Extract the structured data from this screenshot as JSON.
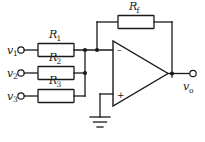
{
  "diagram": {
    "background_color": "#ffffff",
    "line_color": "#1a1a1a"
  },
  "labels": {
    "r1": "R",
    "r1_sub": "1",
    "r2": "R",
    "r2_sub": "2",
    "r3": "R",
    "r3_sub": "3",
    "rf": "R",
    "rf_sub": "f",
    "v1": "v",
    "v1_sub": "1",
    "v2": "v",
    "v2_sub": "2",
    "v3": "v",
    "v3_sub": "3",
    "vo": "v",
    "vo_sub": "o",
    "inverting_sign": "–",
    "noninverting_sign": "+"
  },
  "components": [
    {
      "name": "resistor-r1",
      "label": "R1",
      "type": "resistor"
    },
    {
      "name": "resistor-r2",
      "label": "R2",
      "type": "resistor"
    },
    {
      "name": "resistor-r3",
      "label": "R3",
      "type": "resistor"
    },
    {
      "name": "resistor-rf",
      "label": "Rf",
      "type": "resistor"
    },
    {
      "name": "op-amp",
      "label": "op-amp",
      "type": "amplifier"
    },
    {
      "name": "ground",
      "label": "ground",
      "type": "ground"
    }
  ],
  "terminals": [
    {
      "name": "input-v1",
      "label": "v1"
    },
    {
      "name": "input-v2",
      "label": "v2"
    },
    {
      "name": "input-v3",
      "label": "v3"
    },
    {
      "name": "output-vo",
      "label": "vo"
    }
  ]
}
